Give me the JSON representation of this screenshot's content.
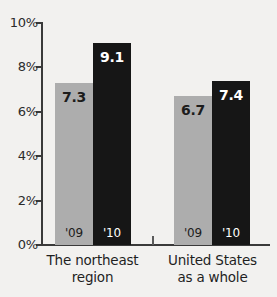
{
  "chart_data": {
    "type": "bar",
    "title": "",
    "subtitle": "",
    "xlabel": "",
    "ylabel": "",
    "ylim": [
      0,
      10
    ],
    "y_unit": "%",
    "grid": false,
    "legend": "none",
    "y_ticks": [
      "0%",
      "2%",
      "4%",
      "6%",
      "8%",
      "10%"
    ],
    "y_tick_values": [
      0,
      2,
      4,
      6,
      8,
      10
    ],
    "categories": [
      "The northeast region",
      "United States as a whole"
    ],
    "category_lines": [
      [
        "The northeast",
        "region"
      ],
      [
        "United States",
        "as a whole"
      ]
    ],
    "series": [
      {
        "name": "'09",
        "values": [
          7.3,
          6.7
        ],
        "color": "#adadad"
      },
      {
        "name": "'10",
        "values": [
          9.1,
          7.4
        ],
        "color": "#161616"
      }
    ],
    "bars": [
      {
        "group": 0,
        "series": 0,
        "year": "'09",
        "value": 7.3,
        "label": "7.3"
      },
      {
        "group": 0,
        "series": 1,
        "year": "'10",
        "value": 9.1,
        "label": "9.1"
      },
      {
        "group": 1,
        "series": 0,
        "year": "'09",
        "value": 6.7,
        "label": "6.7"
      },
      {
        "group": 1,
        "series": 1,
        "year": "'10",
        "value": 7.4,
        "label": "7.4"
      }
    ]
  },
  "colors": {
    "background": "#f2f1ef",
    "axis": "#3a3a3a",
    "bar_light": "#adadad",
    "bar_dark": "#161616",
    "text": "#1f1f1f"
  }
}
